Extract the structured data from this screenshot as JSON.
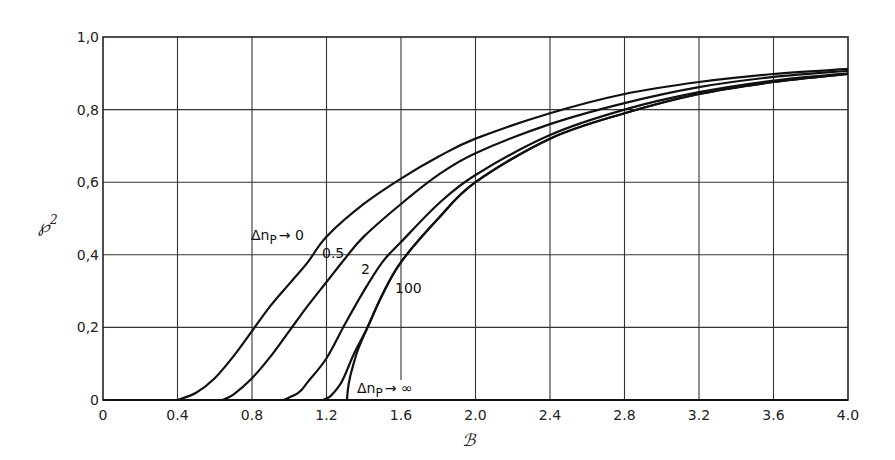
{
  "chart_data": {
    "type": "line",
    "title": "",
    "xlabel": "ℬ",
    "ylabel": "℘²",
    "xlim": [
      0,
      4.0
    ],
    "ylim": [
      0,
      1.0
    ],
    "grid": true,
    "legend": "none (inline curve labels)",
    "x_ticks": [
      "0",
      "0.4",
      "0.8",
      "1.2",
      "1.6",
      "2.0",
      "2.4",
      "2.8",
      "3.2",
      "3.6",
      "4.0"
    ],
    "y_ticks": [
      "0",
      "0.2",
      "0.4",
      "0.6",
      "0.8",
      "1.0"
    ],
    "series": [
      {
        "name": "Δn_P → 0",
        "x": [
          0.4,
          0.5,
          0.6,
          0.7,
          0.8,
          0.9,
          1.0,
          1.1,
          1.2,
          1.4,
          1.6,
          1.8,
          2.0,
          2.4,
          2.8,
          3.2,
          3.6,
          4.0
        ],
        "y": [
          0.0,
          0.02,
          0.06,
          0.12,
          0.19,
          0.26,
          0.32,
          0.38,
          0.45,
          0.54,
          0.61,
          0.67,
          0.72,
          0.79,
          0.843,
          0.876,
          0.898,
          0.912
        ]
      },
      {
        "name": "0.5",
        "x": [
          0.64,
          0.7,
          0.8,
          0.9,
          1.0,
          1.1,
          1.2,
          1.3,
          1.4,
          1.6,
          1.8,
          2.0,
          2.4,
          2.8,
          3.2,
          3.6,
          4.0
        ],
        "y": [
          0.0,
          0.015,
          0.06,
          0.12,
          0.19,
          0.26,
          0.325,
          0.39,
          0.45,
          0.54,
          0.62,
          0.68,
          0.76,
          0.818,
          0.862,
          0.89,
          0.907
        ]
      },
      {
        "name": "2",
        "x": [
          0.97,
          1.05,
          1.1,
          1.2,
          1.3,
          1.4,
          1.5,
          1.6,
          1.8,
          2.0,
          2.4,
          2.8,
          3.2,
          3.6,
          4.0
        ],
        "y": [
          0.0,
          0.02,
          0.05,
          0.115,
          0.21,
          0.3,
          0.38,
          0.435,
          0.54,
          0.62,
          0.73,
          0.8,
          0.848,
          0.88,
          0.9
        ]
      },
      {
        "name": "100",
        "x": [
          1.18,
          1.22,
          1.27,
          1.3,
          1.35,
          1.42,
          1.5,
          1.6,
          1.8,
          2.0,
          2.4,
          2.8,
          3.2,
          3.6,
          4.0
        ],
        "y": [
          0.0,
          0.01,
          0.04,
          0.07,
          0.13,
          0.2,
          0.29,
          0.38,
          0.5,
          0.6,
          0.72,
          0.79,
          0.843,
          0.876,
          0.898
        ]
      },
      {
        "name": "Δn_P → ∞",
        "x": [
          1.31,
          1.315,
          1.325,
          1.34,
          1.37,
          1.42,
          1.5,
          1.6,
          1.8,
          2.0,
          2.4,
          2.8,
          3.2,
          3.6,
          4.0
        ],
        "y": [
          0.0,
          0.03,
          0.06,
          0.09,
          0.14,
          0.2,
          0.29,
          0.38,
          0.5,
          0.6,
          0.72,
          0.79,
          0.843,
          0.876,
          0.898
        ]
      }
    ],
    "annotations": [
      {
        "text": "Δnₚ → 0",
        "x": 0.83,
        "y": 0.48
      },
      {
        "text": "0.5",
        "x": 1.2,
        "y": 0.39
      },
      {
        "text": "2",
        "x": 1.47,
        "y": 0.34
      },
      {
        "text": "100",
        "x": 1.58,
        "y": 0.3
      },
      {
        "text": "Δnₚ → ∞",
        "x": 1.35,
        "y": 0.025
      }
    ]
  },
  "labels": {
    "xlabel": "ℬ",
    "ylabel_main": "℘",
    "ylabel_sup": "2",
    "curve_0_main": "Δn",
    "curve_0_sub": "P",
    "curve_0_tail": "→ 0",
    "curve_05": "0.5",
    "curve_2": "2",
    "curve_100": "100",
    "curve_inf_main": "Δn",
    "curve_inf_sub": "P",
    "curve_inf_tail": "→ ∞"
  },
  "ticks": {
    "x": [
      "0",
      "0.4",
      "0.8",
      "1.2",
      "1.6",
      "2.0",
      "2.4",
      "2.8",
      "3.2",
      "3.6",
      "4.0"
    ],
    "y": [
      "0",
      "0.2",
      "0.4",
      "0.6",
      "0.8",
      "1.0"
    ]
  }
}
